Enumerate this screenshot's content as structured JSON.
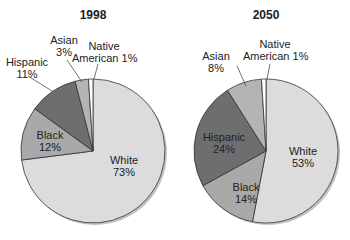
{
  "chart_data": [
    {
      "type": "pie",
      "title": "1998",
      "categories": [
        "White",
        "Black",
        "Hispanic",
        "Asian",
        "Native American"
      ],
      "values": [
        73,
        12,
        11,
        3,
        1
      ],
      "labels": [
        "White 73%",
        "Black 12%",
        "Hispanic 11%",
        "Asian 3%",
        "Native American 1%"
      ],
      "colors": [
        "#dcdcdc",
        "#a9a9a9",
        "#6e6e6e",
        "#b4b4b4",
        "#ffffff"
      ]
    },
    {
      "type": "pie",
      "title": "2050",
      "categories": [
        "White",
        "Black",
        "Hispanic",
        "Asian",
        "Native American"
      ],
      "values": [
        53,
        14,
        24,
        8,
        1
      ],
      "labels": [
        "White 53%",
        "Black 14%",
        "Hispanic 24%",
        "Asian 8%",
        "Native American 1%"
      ],
      "colors": [
        "#dcdcdc",
        "#a9a9a9",
        "#6e6e6e",
        "#b4b4b4",
        "#ffffff"
      ]
    }
  ],
  "left": {
    "title": "1998",
    "white": {
      "name": "White",
      "pct": "73%"
    },
    "black": {
      "name": "Black",
      "pct": "12%"
    },
    "hispanic": {
      "name": "Hispanic",
      "pct": "11%"
    },
    "asian": {
      "name": "Asian",
      "pct": "3%"
    },
    "native": {
      "line1": "Native",
      "line2": "American 1%"
    }
  },
  "right": {
    "title": "2050",
    "white": {
      "name": "White",
      "pct": "53%"
    },
    "black": {
      "name": "Black",
      "pct": "14%"
    },
    "hispanic": {
      "name": "Hispanic",
      "pct": "24%"
    },
    "asian": {
      "name": "Asian",
      "pct": "8%"
    },
    "native": {
      "line1": "Native",
      "line2": "American 1%"
    }
  }
}
